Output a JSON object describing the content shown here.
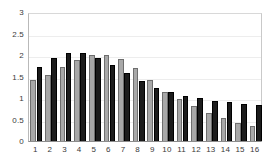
{
  "chart_data": {
    "type": "bar",
    "title": "",
    "subtitle": "",
    "xlabel": "",
    "ylabel": "",
    "categories": [
      "1",
      "2",
      "3",
      "4",
      "5",
      "6",
      "7",
      "8",
      "9",
      "10",
      "11",
      "12",
      "13",
      "14",
      "15",
      "16"
    ],
    "series": [
      {
        "name": "Series 1",
        "color": "#a8a8a8",
        "values": [
          1.43,
          1.53,
          1.72,
          1.89,
          2.01,
          2.01,
          1.9,
          1.69,
          1.42,
          1.15,
          0.97,
          0.81,
          0.66,
          0.54,
          0.43,
          0.35
        ]
      },
      {
        "name": "Series 2",
        "color": "#1c1c1c",
        "values": [
          1.72,
          1.94,
          2.05,
          2.04,
          1.93,
          1.77,
          1.58,
          1.4,
          1.24,
          1.13,
          1.05,
          1.0,
          0.94,
          0.9,
          0.87,
          0.84
        ]
      }
    ],
    "ylim": [
      0,
      3
    ],
    "ytick_labels": [
      "0",
      "0.5",
      "1",
      "1.5",
      "2",
      "2.5",
      "3"
    ],
    "ytick_values": [
      0,
      0.5,
      1,
      1.5,
      2,
      2.5,
      3
    ],
    "xtick_labels": [
      "1",
      "2",
      "3",
      "4",
      "5",
      "6",
      "7",
      "8",
      "9",
      "10",
      "11",
      "12",
      "13",
      "14",
      "15",
      "16"
    ],
    "grid": true,
    "grid_axis": "y",
    "legend": false,
    "legend_position": "none",
    "annotations": []
  },
  "style": {
    "plot_background": "#ffffff",
    "gridline_color": "#ededed",
    "axis_color": "#8d8d8d",
    "tick_label_color": "#3a3a3a"
  }
}
